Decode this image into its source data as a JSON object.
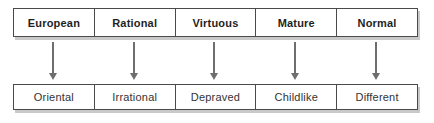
{
  "diagram": {
    "columns": [
      {
        "top": "European",
        "bottom": "Oriental"
      },
      {
        "top": "Rational",
        "bottom": "Irrational"
      },
      {
        "top": "Virtuous",
        "bottom": "Depraved"
      },
      {
        "top": "Mature",
        "bottom": "Childlike"
      },
      {
        "top": "Normal",
        "bottom": "Different"
      }
    ],
    "arrow_icon": "down-arrow",
    "colors": {
      "background": "#ffffff",
      "border": "#4a4a4a",
      "arrow": "#6e6e6e",
      "shadow": "#c9c9c9",
      "top_text": "#1f1f1f",
      "bottom_text": "#333333"
    }
  }
}
